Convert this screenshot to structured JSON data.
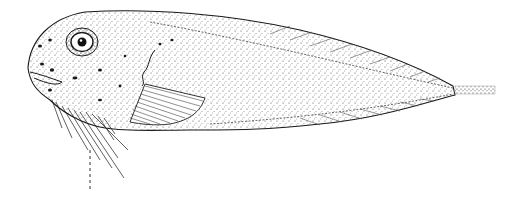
{
  "figure": {
    "background_color": "#ffffff",
    "ink_color": "#1a1a1a",
    "parts": [
      "head",
      "eye",
      "pectoral-fin",
      "pelvic-filaments",
      "dorsal-fin",
      "anal-fin",
      "caudal-filament",
      "broken-line-filament"
    ]
  }
}
